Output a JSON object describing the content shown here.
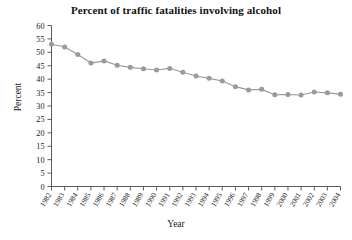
{
  "chart_data": {
    "type": "line",
    "title": "Percent of traffic fatalities involving alcohol",
    "xlabel": "Year",
    "ylabel": "Percent",
    "grid": false,
    "legend": "none",
    "line_color": "#9a9a9a",
    "marker_color": "#9a9a9a",
    "axis_color": "#4a4a4a",
    "xlim": [
      1982,
      2004
    ],
    "ylim": [
      0,
      60
    ],
    "ytick_step": 5,
    "yticks": [
      0,
      5,
      10,
      15,
      20,
      25,
      30,
      35,
      40,
      45,
      50,
      55,
      60
    ],
    "categories": [
      "1982",
      "1983",
      "1984",
      "1985",
      "1986",
      "1987",
      "1988",
      "1989",
      "1990",
      "1991",
      "1992",
      "1993",
      "1994",
      "1995",
      "1996",
      "1997",
      "1998",
      "1999",
      "2000",
      "2001",
      "2002",
      "2003",
      "2004"
    ],
    "values": [
      53.0,
      52.0,
      49.2,
      46.0,
      46.8,
      45.2,
      44.4,
      43.9,
      43.4,
      44.0,
      42.6,
      41.2,
      40.3,
      39.3,
      37.2,
      36.0,
      36.2,
      34.2,
      34.3,
      34.1,
      35.2,
      34.9,
      34.4
    ],
    "series": [
      {
        "name": "Percent of traffic fatalities involving alcohol",
        "values": [
          53.0,
          52.0,
          49.2,
          46.0,
          46.8,
          45.2,
          44.4,
          43.9,
          43.4,
          44.0,
          42.6,
          41.2,
          40.3,
          39.3,
          37.2,
          36.0,
          36.2,
          34.2,
          34.3,
          34.1,
          35.2,
          34.9,
          34.4
        ]
      }
    ]
  }
}
